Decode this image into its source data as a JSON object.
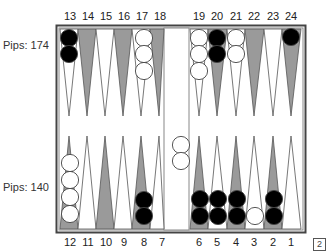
{
  "board": {
    "top_pips_label": "Pips: 174",
    "bottom_pips_label": "Pips: 140",
    "doubling_cube": "2",
    "colors": {
      "dark_point": "#9a9a9a",
      "light_point": "#ffffff",
      "black_checker": "#000000",
      "white_checker": "#ffffff",
      "frame": "#444444"
    },
    "top_point_labels": [
      "13",
      "14",
      "15",
      "16",
      "17",
      "18",
      "19",
      "20",
      "21",
      "22",
      "23",
      "24"
    ],
    "bottom_point_labels": [
      "12",
      "11",
      "10",
      "9",
      "8",
      "7",
      "6",
      "5",
      "4",
      "3",
      "2",
      "1"
    ],
    "points": {
      "13": {
        "color": "black",
        "count": 2
      },
      "17": {
        "color": "white",
        "count": 3
      },
      "19": {
        "color": "white",
        "count": 3
      },
      "20": {
        "color": "black",
        "count": 2
      },
      "21": {
        "color": "white",
        "count": 2
      },
      "24": {
        "color": "black",
        "count": 1
      },
      "12": {
        "color": "white",
        "count": 4
      },
      "8": {
        "color": "black",
        "count": 2
      },
      "6": {
        "color": "black",
        "count": 2
      },
      "5": {
        "color": "black",
        "count": 2
      },
      "4": {
        "color": "black",
        "count": 2
      },
      "3": {
        "color": "white",
        "count": 1
      },
      "2": {
        "color": "black",
        "count": 2
      }
    },
    "bar": {
      "color": "white",
      "count": 2
    }
  }
}
